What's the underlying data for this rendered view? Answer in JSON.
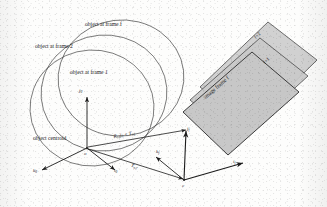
{
  "figure": {
    "background_color": "#fdfdfc",
    "stroke_color": "#1c1c1c",
    "plane_fill_color": "#c9c9c9"
  },
  "object_labels": {
    "frame_f": "object at frame f",
    "frame_2": "object at frame 2",
    "frame_1": "object at frame 1",
    "centroid": "object centroid",
    "origin": "o"
  },
  "object_axes": [
    {
      "name": "j0",
      "base": "j",
      "sub": "0"
    },
    {
      "name": "i0",
      "base": "i",
      "sub": "0"
    },
    {
      "name": "k0",
      "base": "k",
      "sub": "0"
    }
  ],
  "camera_labels": {
    "origin": "c",
    "image_frame_f": "image frame f",
    "frame_f_plus_1": "f+1",
    "frame_f_plus_2": "f+2"
  },
  "camera_axes": [
    {
      "name": "jf",
      "base": "j",
      "sub": "f"
    },
    {
      "name": "if",
      "base": "i",
      "sub": "f"
    },
    {
      "name": "kf",
      "base": "k",
      "sub": "f"
    }
  ],
  "vectors": {
    "rotation_translation": {
      "R": "R",
      "R_sub": "o,f",
      "j": "j",
      "j_sub": "0",
      "plus": " + ",
      "T": "T",
      "T_sub": "o,f"
    },
    "translation": {
      "T": "T",
      "T_sub": "o,f"
    }
  }
}
